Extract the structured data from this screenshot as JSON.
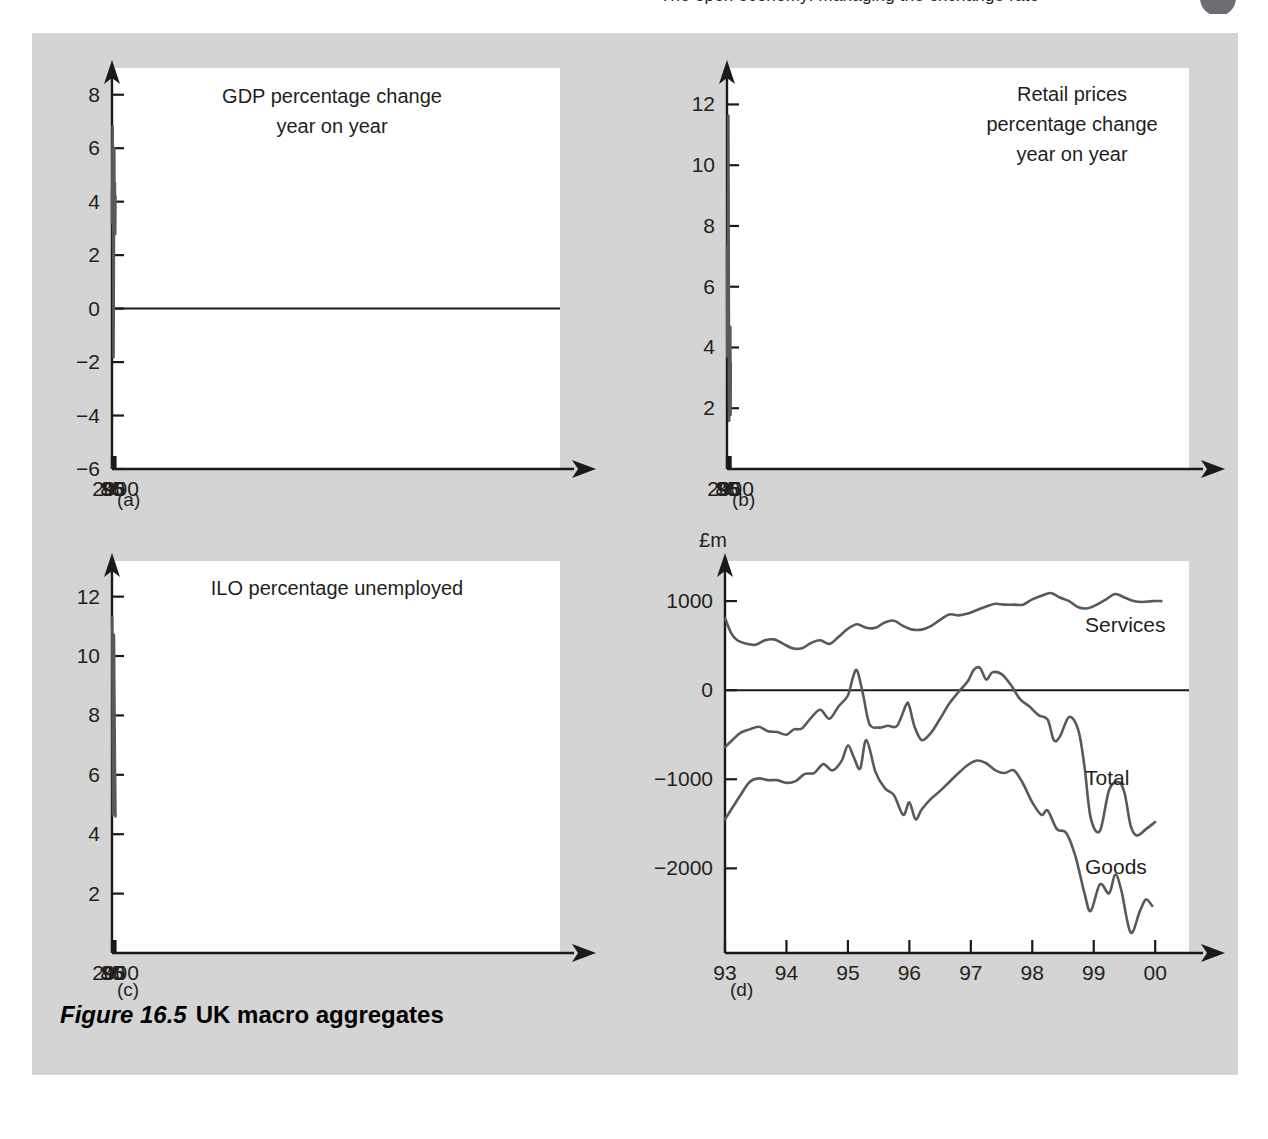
{
  "running_head": {
    "text": "The open economy: managing the exchange rate",
    "page_badge": ""
  },
  "figure": {
    "caption_number": "Figure 16.5",
    "caption_text": "UK macro aggregates",
    "panel_letters": [
      "(a)",
      "(b)",
      "(c)",
      "(d)"
    ],
    "background_color": "#d4d4d4",
    "plot_background": "#ffffff",
    "line_color": "#58595b",
    "axis_color": "#1a1a1a"
  },
  "chart_data": [
    {
      "id": "a",
      "panel_letter": "(a)",
      "type": "line",
      "title": "GDP percentage change\nyear on year",
      "title_lines": [
        "GDP percentage change",
        "year on year"
      ],
      "xlabel": "",
      "ylabel": "",
      "xlim": [
        85,
        2000.6
      ],
      "ylim": [
        -6,
        9
      ],
      "ytick_labels": [
        "8",
        "6",
        "4",
        "2",
        "0",
        "−2",
        "−4",
        "−6"
      ],
      "ytick_values": [
        8,
        6,
        4,
        2,
        0,
        -2,
        -4,
        -6
      ],
      "xtick_labels": [
        "85",
        "90",
        "95",
        "2000"
      ],
      "xtick_values": [
        85,
        90,
        95,
        100
      ],
      "zero_line": true,
      "grid": false,
      "legend": "none",
      "series": [
        {
          "name": "GDP percentage change year on year",
          "x": [
            85.0,
            85.2,
            85.5,
            85.8,
            86.0,
            86.3,
            86.6,
            86.9,
            87.2,
            87.5,
            87.8,
            88.0,
            88.3,
            88.6,
            88.9,
            89.2,
            89.5,
            89.8,
            90.0,
            90.2,
            90.5,
            90.8,
            91.0,
            91.3,
            91.6,
            91.9,
            92.2,
            92.5,
            92.8,
            93.1,
            93.4,
            93.7,
            94.0,
            94.3,
            94.6,
            94.9,
            95.1,
            95.4,
            95.7,
            96.0,
            96.3,
            96.6,
            96.9,
            97.2,
            97.5,
            97.8,
            98.1,
            98.4,
            98.7,
            99.0,
            99.3,
            99.6,
            100.0
          ],
          "y": [
            3.2,
            4.1,
            4.5,
            4.2,
            4.1,
            4.8,
            5.7,
            5.3,
            5.8,
            6.4,
            6.8,
            6.7,
            6.3,
            5.6,
            5.5,
            4.8,
            3.9,
            3.0,
            2.1,
            2.1,
            2.0,
            1.0,
            -0.4,
            -1.6,
            -1.8,
            -1.3,
            -0.1,
            0.7,
            1.5,
            2.4,
            3.4,
            4.3,
            5.3,
            5.9,
            6.0,
            5.9,
            5.2,
            3.6,
            3.4,
            3.4,
            3.8,
            4.3,
            4.6,
            4.7,
            4.5,
            4.0,
            3.4,
            2.9,
            2.8,
            3.1,
            3.5,
            4.0,
            4.2
          ]
        }
      ]
    },
    {
      "id": "b",
      "panel_letter": "(b)",
      "type": "line",
      "title": "Retail prices\npercentage change\nyear on year",
      "title_lines": [
        "Retail prices",
        "percentage change",
        "year on year"
      ],
      "xlabel": "",
      "ylabel": "",
      "xlim": [
        85,
        2000.8
      ],
      "ylim": [
        0,
        13.2
      ],
      "ytick_labels": [
        "12",
        "10",
        "8",
        "6",
        "4",
        "2"
      ],
      "ytick_values": [
        12,
        10,
        8,
        6,
        4,
        2
      ],
      "xtick_labels": [
        "85",
        "90",
        "95",
        "2000"
      ],
      "xtick_values": [
        85,
        90,
        95,
        100
      ],
      "zero_line": false,
      "grid": false,
      "legend": "none",
      "series": [
        {
          "name": "Retail prices percentage change year on year",
          "x": [
            85.0,
            85.2,
            85.4,
            85.6,
            85.8,
            86.0,
            86.3,
            86.6,
            86.9,
            87.2,
            87.5,
            87.8,
            88.0,
            88.2,
            88.5,
            88.8,
            89.1,
            89.4,
            89.6,
            89.8,
            90.0,
            90.2,
            90.4,
            90.6,
            90.8,
            91.0,
            91.2,
            91.5,
            91.8,
            92.1,
            92.4,
            92.7,
            93.0,
            93.2,
            93.5,
            93.8,
            94.0,
            94.3,
            94.6,
            94.9,
            95.2,
            95.5,
            95.8,
            96.0,
            96.3,
            96.6,
            96.9,
            97.2,
            97.5,
            97.8,
            98.0,
            98.3,
            98.6,
            98.9,
            99.1,
            99.3,
            99.6,
            99.9,
            100.2,
            100.5
          ],
          "y": [
            6.6,
            7.3,
            6.2,
            5.9,
            5.4,
            4.6,
            3.9,
            3.7,
            4.0,
            4.5,
            4.6,
            4.4,
            4.3,
            5.3,
            6.5,
            7.6,
            8.6,
            8.7,
            8.4,
            9.0,
            9.5,
            9.8,
            10.6,
            11.4,
            11.6,
            10.9,
            9.9,
            8.9,
            7.8,
            6.9,
            5.7,
            5.3,
            4.3,
            3.3,
            2.2,
            1.7,
            1.6,
            1.9,
            2.4,
            2.6,
            2.8,
            3.2,
            3.6,
            4.1,
            3.8,
            3.5,
            3.3,
            3.4,
            3.7,
            4.1,
            4.5,
            4.4,
            4.6,
            4.6,
            3.6,
            2.1,
            1.8,
            1.9,
            2.6,
            3.5
          ]
        }
      ]
    },
    {
      "id": "c",
      "panel_letter": "(c)",
      "type": "line",
      "title": "ILO percentage unemployed",
      "title_lines": [
        "ILO percentage unemployed"
      ],
      "xlabel": "",
      "ylabel": "",
      "xlim": [
        85,
        2000.3
      ],
      "ylim": [
        0,
        13.2
      ],
      "ytick_labels": [
        "12",
        "10",
        "8",
        "6",
        "4",
        "2"
      ],
      "ytick_values": [
        12,
        10,
        8,
        6,
        4,
        2
      ],
      "xtick_labels": [
        "85",
        "90",
        "95",
        "2000"
      ],
      "xtick_values": [
        85,
        90,
        95,
        100
      ],
      "zero_line": false,
      "grid": false,
      "legend": "none",
      "series": [
        {
          "name": "ILO percentage unemployed",
          "x": [
            85.0,
            85.3,
            85.6,
            85.9,
            86.2,
            86.5,
            86.8,
            87.1,
            87.4,
            87.7,
            88.0,
            88.3,
            88.6,
            88.9,
            89.2,
            89.5,
            89.8,
            90.0,
            90.3,
            90.6,
            90.9,
            91.2,
            91.5,
            91.8,
            92.1,
            92.4,
            92.7,
            93.0,
            93.3,
            93.6,
            93.9,
            94.2,
            94.5,
            94.8,
            95.1,
            95.4,
            95.7,
            96.0,
            96.3,
            96.6,
            96.9,
            97.2,
            97.5,
            97.8,
            98.1,
            98.4,
            98.7,
            99.0,
            99.3,
            99.6,
            99.9
          ],
          "y": [
            11.0,
            11.2,
            11.3,
            11.3,
            11.2,
            10.8,
            10.1,
            9.5,
            9.0,
            8.3,
            7.6,
            6.9,
            6.2,
            5.5,
            5.0,
            4.7,
            4.7,
            4.9,
            5.5,
            6.3,
            7.1,
            7.6,
            8.3,
            9.0,
            9.6,
            10.1,
            10.5,
            10.7,
            10.7,
            10.5,
            10.2,
            9.9,
            9.5,
            9.1,
            8.8,
            8.6,
            8.3,
            7.9,
            7.6,
            7.3,
            7.0,
            6.7,
            6.4,
            6.1,
            6.0,
            5.8,
            5.5,
            5.3,
            5.1,
            4.8,
            4.6
          ]
        }
      ]
    },
    {
      "id": "d",
      "panel_letter": "(d)",
      "type": "line",
      "title": "",
      "title_lines": [],
      "xlabel": "Balance of trade",
      "ylabel": "",
      "unit_label": "£m",
      "xlim": [
        93,
        100.55
      ],
      "ylim": [
        -2950,
        1450
      ],
      "ytick_labels": [
        "1000",
        "0",
        "−1000",
        "−2000"
      ],
      "ytick_values": [
        1000,
        0,
        -1000,
        -2000
      ],
      "xtick_labels": [
        "93",
        "94",
        "95",
        "96",
        "97",
        "98",
        "99",
        "00"
      ],
      "xtick_values": [
        93,
        94,
        95,
        96,
        97,
        98,
        99,
        100
      ],
      "zero_line": true,
      "grid": false,
      "legend": "inline-right",
      "series": [
        {
          "name": "Services",
          "label": "Services",
          "x": [
            93.0,
            93.1,
            93.2,
            93.35,
            93.5,
            93.65,
            93.8,
            93.95,
            94.1,
            94.25,
            94.4,
            94.55,
            94.7,
            94.85,
            95.0,
            95.15,
            95.3,
            95.45,
            95.6,
            95.75,
            95.9,
            96.05,
            96.2,
            96.35,
            96.5,
            96.65,
            96.8,
            96.95,
            97.1,
            97.25,
            97.4,
            97.55,
            97.7,
            97.85,
            98.0,
            98.15,
            98.3,
            98.45,
            98.6,
            98.75,
            98.9,
            99.05,
            99.2,
            99.35,
            99.5,
            99.65,
            99.8,
            99.95,
            100.1
          ],
          "y": [
            810,
            640,
            560,
            520,
            510,
            560,
            570,
            520,
            470,
            470,
            530,
            560,
            520,
            600,
            690,
            740,
            700,
            700,
            760,
            780,
            720,
            680,
            680,
            720,
            790,
            850,
            840,
            860,
            900,
            940,
            970,
            960,
            960,
            960,
            1020,
            1060,
            1090,
            1040,
            1000,
            930,
            920,
            960,
            1020,
            1080,
            1040,
            1000,
            990,
            1000,
            1000
          ]
        },
        {
          "name": "Total",
          "label": "Total",
          "x": [
            93.0,
            93.12,
            93.25,
            93.4,
            93.55,
            93.7,
            93.85,
            94.0,
            94.12,
            94.25,
            94.4,
            94.55,
            94.7,
            94.85,
            95.0,
            95.08,
            95.15,
            95.25,
            95.35,
            95.5,
            95.65,
            95.8,
            95.95,
            96.0,
            96.08,
            96.2,
            96.35,
            96.5,
            96.65,
            96.8,
            96.95,
            97.05,
            97.15,
            97.25,
            97.35,
            97.5,
            97.65,
            97.8,
            97.95,
            98.1,
            98.25,
            98.35,
            98.45,
            98.6,
            98.75,
            98.85,
            98.95,
            99.1,
            99.25,
            99.4,
            99.5,
            99.6,
            99.7,
            99.85,
            100.0
          ],
          "y": [
            -640,
            -560,
            -480,
            -440,
            -410,
            -460,
            -470,
            -500,
            -440,
            -430,
            -310,
            -220,
            -320,
            -180,
            -60,
            140,
            220,
            -60,
            -380,
            -420,
            -400,
            -400,
            -160,
            -180,
            -400,
            -560,
            -480,
            -320,
            -150,
            -20,
            100,
            230,
            250,
            120,
            200,
            180,
            60,
            -100,
            -180,
            -280,
            -330,
            -560,
            -520,
            -300,
            -450,
            -860,
            -1430,
            -1580,
            -1120,
            -1030,
            -1150,
            -1520,
            -1630,
            -1560,
            -1480
          ]
        },
        {
          "name": "Goods",
          "label": "Goods",
          "x": [
            93.0,
            93.12,
            93.25,
            93.4,
            93.55,
            93.7,
            93.85,
            94.0,
            94.15,
            94.3,
            94.45,
            94.6,
            94.75,
            94.9,
            95.0,
            95.1,
            95.2,
            95.3,
            95.45,
            95.6,
            95.75,
            95.9,
            96.0,
            96.1,
            96.2,
            96.35,
            96.5,
            96.65,
            96.8,
            96.95,
            97.1,
            97.25,
            97.4,
            97.55,
            97.7,
            97.85,
            98.0,
            98.15,
            98.25,
            98.4,
            98.55,
            98.7,
            98.85,
            98.95,
            99.1,
            99.25,
            99.35,
            99.45,
            99.6,
            99.75,
            99.85,
            99.95
          ],
          "y": [
            -1450,
            -1320,
            -1180,
            -1030,
            -990,
            -1010,
            -1010,
            -1040,
            -1020,
            -940,
            -930,
            -830,
            -900,
            -790,
            -620,
            -760,
            -880,
            -560,
            -920,
            -1100,
            -1180,
            -1400,
            -1260,
            -1450,
            -1340,
            -1220,
            -1130,
            -1030,
            -930,
            -840,
            -790,
            -820,
            -900,
            -930,
            -900,
            -1050,
            -1260,
            -1400,
            -1350,
            -1560,
            -1600,
            -1860,
            -2280,
            -2480,
            -2180,
            -2280,
            -2070,
            -2250,
            -2720,
            -2480,
            -2350,
            -2420
          ]
        }
      ]
    }
  ]
}
